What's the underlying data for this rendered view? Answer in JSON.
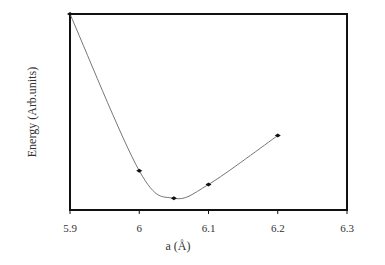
{
  "chart_data": {
    "type": "line",
    "title": "",
    "xlabel": "a (Å)",
    "ylabel": "Energy (Arb.units)",
    "xlim": [
      5.9,
      6.3
    ],
    "ylim": [
      0,
      1
    ],
    "x_ticks": [
      "5.9",
      "6",
      "6.1",
      "6.2",
      "6.3"
    ],
    "y_ticks": [],
    "grid": false,
    "legend": null,
    "series": [
      {
        "name": "Energy",
        "markers": true,
        "x": [
          5.9,
          6.0,
          6.05,
          6.1,
          6.2
        ],
        "values": [
          1.0,
          0.2,
          0.06,
          0.13,
          0.38
        ]
      }
    ]
  }
}
